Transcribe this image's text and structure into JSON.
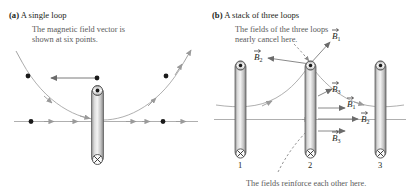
{
  "figure": {
    "width": 413,
    "height": 196,
    "background": "#ffffff",
    "ink": "#231f20",
    "annotation_color": "#5a5a5a",
    "field_line_color": "#9a9a9a",
    "axis_color": "#8e8e8e"
  },
  "panel_a": {
    "tag": "(a)",
    "heading": "A single loop",
    "annotation": {
      "line1": "The magnetic field vector is",
      "line2": "shown at six points."
    },
    "loop": {
      "top_marker": "current-out-of-page",
      "bottom_marker": "current-into-page"
    },
    "field_point_count": 6
  },
  "panel_b": {
    "tag": "(b)",
    "heading": "A stack of three loops",
    "annotation_top": {
      "line1": "The fields of the three loops",
      "line2": "nearly cancel here."
    },
    "annotation_bottom": "The fields reinforce each other here.",
    "loop_numbers": [
      "1",
      "2",
      "3"
    ],
    "vector_labels_upper": [
      {
        "name": "B1",
        "base": "B",
        "sub": "1"
      },
      {
        "name": "B2",
        "base": "B",
        "sub": "2"
      }
    ],
    "vector_labels_lower": [
      {
        "name": "B3-upper",
        "base": "B",
        "sub": "3"
      },
      {
        "name": "B1",
        "base": "B",
        "sub": "1"
      },
      {
        "name": "B2",
        "base": "B",
        "sub": "2"
      },
      {
        "name": "B3",
        "base": "B",
        "sub": "3"
      }
    ],
    "loop": {
      "top_marker": "current-out-of-page",
      "bottom_marker": "current-into-page"
    }
  }
}
